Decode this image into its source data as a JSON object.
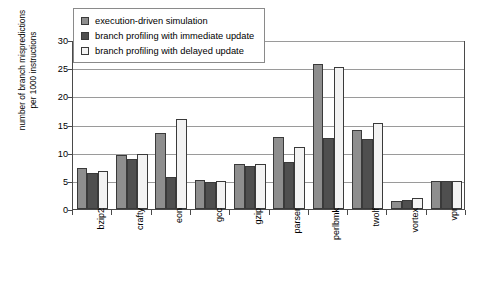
{
  "chart_data": {
    "type": "bar",
    "title": "",
    "xlabel": "",
    "ylabel": "number of branch mispredictions\nper 1000 instructions",
    "ylim": [
      0,
      30
    ],
    "yticks": [
      0,
      5,
      10,
      15,
      20,
      25,
      30
    ],
    "grid": true,
    "legend_position": "top-left-inside",
    "categories": [
      "bzip2",
      "crafty",
      "eon",
      "gcc",
      "gzip",
      "parser",
      "perlbmk",
      "twolf",
      "vortex",
      "vpr"
    ],
    "series": [
      {
        "name": "execution-driven simulation",
        "color": "#8e8e8e",
        "values": [
          7.2,
          9.6,
          13.5,
          5.2,
          8.0,
          12.8,
          25.7,
          14.1,
          1.5,
          5.0
        ]
      },
      {
        "name": "branch profiling with immediate update",
        "color": "#4f4f4f",
        "values": [
          6.4,
          8.8,
          5.6,
          4.8,
          7.6,
          8.4,
          12.6,
          12.5,
          1.6,
          5.0
        ]
      },
      {
        "name": "branch profiling with delayed update",
        "color": "#f3f3f3",
        "values": [
          6.8,
          9.7,
          16.0,
          5.0,
          8.0,
          11.0,
          25.2,
          15.3,
          2.0,
          5.0
        ]
      }
    ]
  }
}
